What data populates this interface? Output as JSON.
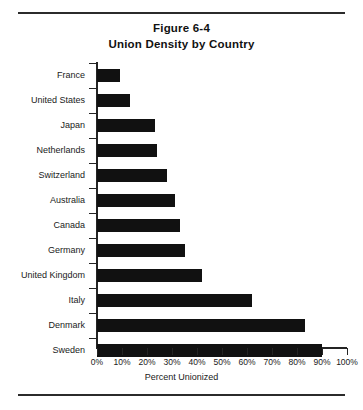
{
  "figure": {
    "title_line1": "Figure 6-4",
    "title_line2": "Union Density by Country"
  },
  "chart_data": {
    "type": "bar",
    "orientation": "horizontal",
    "subtitle": "Union Density by Country",
    "xlabel": "Percent Unionized",
    "ylabel": "",
    "xlim": [
      0,
      100
    ],
    "grid": false,
    "legend": null,
    "xticks": [
      0,
      10,
      20,
      30,
      40,
      50,
      60,
      70,
      80,
      90,
      100
    ],
    "xticklabels": [
      "0%",
      "10%",
      "20%",
      "30%",
      "40%",
      "50%",
      "60%",
      "70%",
      "80%",
      "90%",
      "100%"
    ],
    "categories": [
      "France",
      "United States",
      "Japan",
      "Netherlands",
      "Switzerland",
      "Australia",
      "Canada",
      "Germany",
      "United Kingdom",
      "Italy",
      "Denmark",
      "Sweden"
    ],
    "values": [
      9,
      13,
      23,
      24,
      28,
      31,
      33,
      35,
      42,
      62,
      83,
      90
    ],
    "bar_color": "#111111",
    "axis_color": "#242424"
  }
}
